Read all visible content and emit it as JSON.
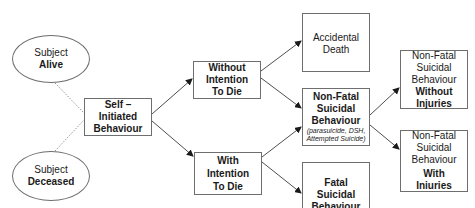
{
  "diagram": {
    "type": "flowchart",
    "nodes": {
      "subject_alive": {
        "line1": "Subject",
        "line2": "Alive"
      },
      "subject_deceased": {
        "line1": "Subject",
        "line2": "Deceased"
      },
      "self_initiated": {
        "line1": "Self –",
        "line2": "Initiated",
        "line3": "Behaviour"
      },
      "without_intention": {
        "line1": "Without",
        "line2": "Intention",
        "line3": "To Die"
      },
      "with_intention": {
        "line1": "With",
        "line2": "Intention",
        "line3": "To Die"
      },
      "accidental_death": {
        "line1": "Accidental",
        "line2": "Death"
      },
      "non_fatal": {
        "line1": "Non-Fatal",
        "line2": "Suicidal",
        "line3": "Behaviour",
        "note1": "(parasuicide, DSH,",
        "note2": "Attempted Suicide)"
      },
      "fatal": {
        "line1": "Fatal",
        "line2": "Suicidal",
        "line3": "Behaviour"
      },
      "non_fatal_without_injuries": {
        "line1": "Non-Fatal",
        "line2": "Suicidal",
        "line3": "Behaviour",
        "line4": "Without",
        "line5": "Injuries"
      },
      "non_fatal_with_injuries": {
        "line1": "Non-Fatal",
        "line2": "Suicidal",
        "line3": "Behaviour",
        "line4": "With",
        "line5": "Iniuries"
      }
    },
    "edges": [
      {
        "from": "subject_alive",
        "to": "self_initiated",
        "style": "dotted"
      },
      {
        "from": "subject_deceased",
        "to": "self_initiated",
        "style": "dotted"
      },
      {
        "from": "self_initiated",
        "to": "without_intention",
        "style": "arrow"
      },
      {
        "from": "self_initiated",
        "to": "with_intention",
        "style": "arrow"
      },
      {
        "from": "without_intention",
        "to": "accidental_death",
        "style": "arrow"
      },
      {
        "from": "without_intention",
        "to": "non_fatal",
        "style": "arrow"
      },
      {
        "from": "with_intention",
        "to": "non_fatal",
        "style": "arrow"
      },
      {
        "from": "with_intention",
        "to": "fatal",
        "style": "arrow"
      },
      {
        "from": "non_fatal",
        "to": "non_fatal_without_injuries",
        "style": "arrow"
      },
      {
        "from": "non_fatal",
        "to": "non_fatal_with_injuries",
        "style": "arrow"
      }
    ],
    "colors": {
      "line": "#3a3a3a",
      "border": "#6e6e6e",
      "text": "#1a1a1a"
    }
  }
}
